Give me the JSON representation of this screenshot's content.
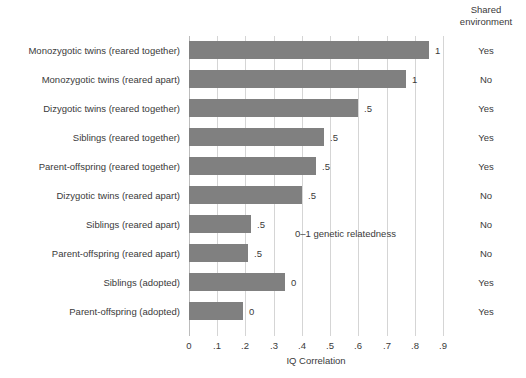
{
  "chart_data": {
    "type": "bar",
    "orientation": "horizontal",
    "title": "",
    "xlabel": "IQ Correlation",
    "ylabel": "",
    "xlim": [
      0,
      0.9
    ],
    "xticks": [
      "0",
      ".1",
      ".2",
      ".3",
      ".4",
      ".5",
      ".6",
      ".7",
      ".8",
      ".9"
    ],
    "xtick_values": [
      0,
      0.1,
      0.2,
      0.3,
      0.4,
      0.5,
      0.6,
      0.7,
      0.8,
      0.9
    ],
    "grid": true,
    "legend": "none",
    "bar_color": "#808080",
    "gridline_color": "#d5d5d5",
    "annotations": [
      {
        "text": "0–1 genetic relatedness"
      }
    ],
    "extra_column_header": "Shared environment",
    "categories": [
      "Monozygotic twins (reared together)",
      "Monozygotic twins (reared apart)",
      "Dizygotic twins (reared together)",
      "Siblings (reared together)",
      "Parent-offspring (reared together)",
      "Dizygotic twins (reared apart)",
      "Siblings (reared apart)",
      "Parent-offspring (reared apart)",
      "Siblings (adopted)",
      "Parent-offspring (adopted)"
    ],
    "values": [
      0.85,
      0.77,
      0.6,
      0.48,
      0.45,
      0.4,
      0.22,
      0.21,
      0.34,
      0.19
    ],
    "point_labels": [
      "1",
      "1",
      ".5",
      ".5",
      ".5",
      ".5",
      ".5",
      ".5",
      "0",
      "0"
    ],
    "shared_environment": [
      "Yes",
      "No",
      "Yes",
      "Yes",
      "Yes",
      "No",
      "No",
      "No",
      "Yes",
      "Yes"
    ],
    "rows": [
      {
        "label": "Monozygotic twins (reared together)",
        "value": 0.85,
        "genetic_relatedness": "1",
        "shared_environment": "Yes"
      },
      {
        "label": "Monozygotic twins (reared apart)",
        "value": 0.77,
        "genetic_relatedness": "1",
        "shared_environment": "No"
      },
      {
        "label": "Dizygotic twins (reared together)",
        "value": 0.6,
        "genetic_relatedness": ".5",
        "shared_environment": "Yes"
      },
      {
        "label": "Siblings (reared together)",
        "value": 0.48,
        "genetic_relatedness": ".5",
        "shared_environment": "Yes"
      },
      {
        "label": "Parent-offspring (reared together)",
        "value": 0.45,
        "genetic_relatedness": ".5",
        "shared_environment": "Yes"
      },
      {
        "label": "Dizygotic twins (reared apart)",
        "value": 0.4,
        "genetic_relatedness": ".5",
        "shared_environment": "No"
      },
      {
        "label": "Siblings (reared apart)",
        "value": 0.22,
        "genetic_relatedness": ".5",
        "shared_environment": "No"
      },
      {
        "label": "Parent-offspring (reared apart)",
        "value": 0.21,
        "genetic_relatedness": ".5",
        "shared_environment": "No"
      },
      {
        "label": "Siblings (adopted)",
        "value": 0.34,
        "genetic_relatedness": "0",
        "shared_environment": "Yes"
      },
      {
        "label": "Parent-offspring (adopted)",
        "value": 0.19,
        "genetic_relatedness": "0",
        "shared_environment": "Yes"
      }
    ]
  },
  "header": {
    "shared_environment_line1": "Shared",
    "shared_environment_line2": "environment"
  },
  "annotation": {
    "relatedness_note": "0–1 genetic relatedness"
  },
  "axis": {
    "x_title": "IQ Correlation"
  }
}
